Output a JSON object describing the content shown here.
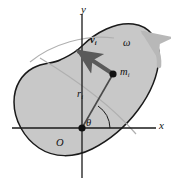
{
  "figure": {
    "background_color": "#ffffff",
    "body_fill_color": "#c8c8c8",
    "body_outline_color": "#1a1a1a",
    "axis_color": "#1a1a1a",
    "vector_color": "#595959",
    "omega_arrow_color": "#b4b4b4",
    "arc_color": "#a8a8a8"
  },
  "labels": {
    "axis_y": "y",
    "axis_x": "x",
    "velocity": {
      "symbol": "v",
      "subscript": "i"
    },
    "omega": "ω",
    "mass": {
      "symbol": "m",
      "subscript": "i"
    },
    "radius": {
      "symbol": "r",
      "subscript": "i"
    },
    "angle": "θ",
    "origin": "O"
  },
  "points": {
    "origin": {
      "x": 82,
      "y": 128
    },
    "mass_particle": {
      "x": 113,
      "y": 74
    }
  },
  "vectors": {
    "velocity": {
      "tail_x": 113,
      "tail_y": 74,
      "head_x": 74,
      "head_y": 48
    },
    "radius_line": {
      "from_x": 82,
      "from_y": 128,
      "to_x": 113,
      "to_y": 74
    }
  }
}
